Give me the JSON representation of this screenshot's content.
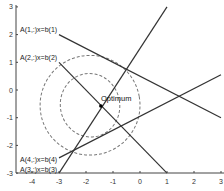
{
  "chart_data": {
    "type": "line",
    "title": "",
    "xlabel": "",
    "ylabel": "",
    "xlim": [
      -4.5,
      3
    ],
    "ylim": [
      -3,
      3
    ],
    "xticks": [
      -4,
      -3,
      -2,
      -1,
      0,
      1,
      2,
      3
    ],
    "yticks": [
      -3,
      -2,
      -1,
      0,
      1,
      2,
      3
    ],
    "grid": false,
    "series": [
      {
        "name": "A(1,:)x=b(1)",
        "x": [
          -3,
          3
        ],
        "y": [
          2,
          -1
        ],
        "style": "solid"
      },
      {
        "name": "A(2,:)x=b(2)",
        "x": [
          -3,
          1
        ],
        "y": [
          1,
          -3
        ],
        "style": "solid"
      },
      {
        "name": "A(3,:)x=b(3)",
        "x": [
          -3,
          1
        ],
        "y": [
          -3,
          3
        ],
        "style": "solid"
      },
      {
        "name": "A(4,:)x=b(4)",
        "x": [
          -3,
          3
        ],
        "y": [
          -2.45,
          0.55
        ],
        "style": "solid"
      }
    ],
    "contours": [
      {
        "name": "outer-contour",
        "cx": -1.85,
        "cy": -0.55,
        "rx": 1.85,
        "ry": 1.8,
        "style": "dashed"
      },
      {
        "name": "inner-contour",
        "cx": -1.85,
        "cy": -0.55,
        "rx": 1.1,
        "ry": 1.15,
        "style": "dashed"
      }
    ],
    "annotations": [
      {
        "text": "Optimum",
        "x": -1.45,
        "y": -0.58,
        "marker": "dot"
      },
      {
        "text": "A(1,:)x=b(1)",
        "x": -4.3,
        "y": 2.25
      },
      {
        "text": "A(2,:)x=b(2)",
        "x": -4.3,
        "y": 1.25
      },
      {
        "text": "A(4,:)x=b(4)",
        "x": -4.3,
        "y": -2.5
      },
      {
        "text": "A(3,:)x=b(3)",
        "x": -4.3,
        "y": -2.85
      }
    ]
  },
  "labels": {
    "optimum": "Optimum",
    "l1": "A(1,:)x=b(1)",
    "l2": "A(2,:)x=b(2)",
    "l3": "A(3,:)x=b(3)",
    "l4": "A(4,:)x=b(4)"
  }
}
